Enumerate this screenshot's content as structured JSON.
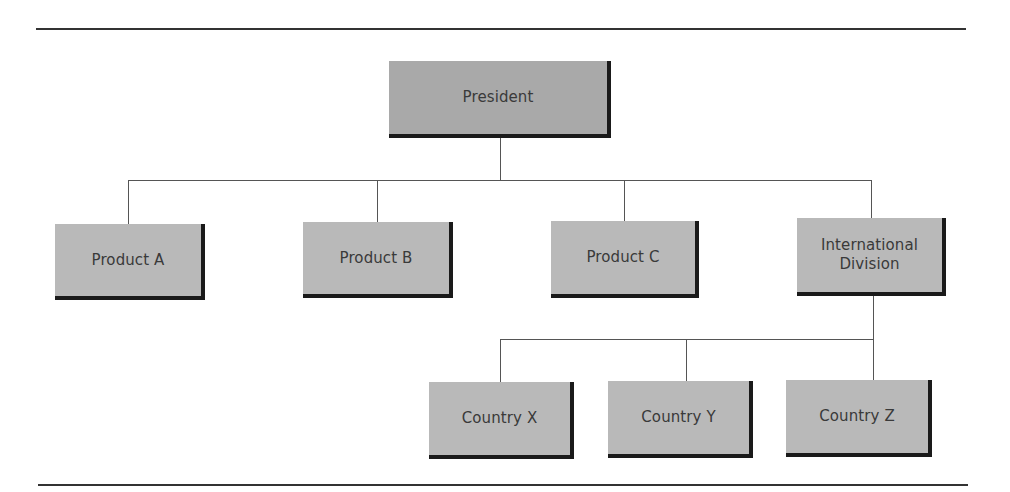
{
  "chart": {
    "type": "organization-chart",
    "root": {
      "label": "President",
      "children": [
        {
          "label": "Product A"
        },
        {
          "label": "Product B"
        },
        {
          "label": "Product C"
        },
        {
          "label": "International\nDivision",
          "children": [
            {
              "label": "Country X"
            },
            {
              "label": "Country Y"
            },
            {
              "label": "Country Z"
            }
          ]
        }
      ]
    }
  },
  "nodes": {
    "president": "President",
    "product_a": "Product A",
    "product_b": "Product B",
    "product_c": "Product C",
    "international_division": "International\nDivision",
    "country_x": "Country X",
    "country_y": "Country Y",
    "country_z": "Country Z"
  },
  "colors": {
    "box_fill": "#b9b9b9",
    "root_fill": "#a9a9a9",
    "shadow": "#1a1a1a",
    "connector": "#555555",
    "text": "#3a3a3a"
  }
}
